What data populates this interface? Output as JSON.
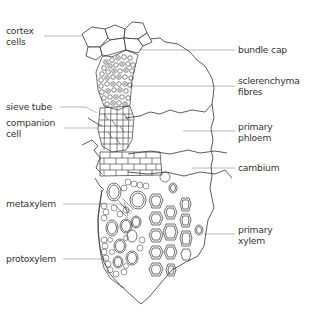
{
  "figure": {
    "colors": {
      "line": "#333333",
      "leader": "#9a9a9a",
      "text": "#333333",
      "background": "#ffffff"
    },
    "labels_left": [
      {
        "id": "cortex-cells",
        "lines": [
          "cortex",
          "cells"
        ]
      },
      {
        "id": "sieve-tube",
        "lines": [
          "sieve tube"
        ]
      },
      {
        "id": "companion-cell",
        "lines": [
          "companion",
          "cell"
        ]
      },
      {
        "id": "metaxylem",
        "lines": [
          "metaxylem"
        ]
      },
      {
        "id": "protoxylem",
        "lines": [
          "protoxylem"
        ]
      }
    ],
    "labels_right": [
      {
        "id": "bundle-cap",
        "lines": [
          "bundle cap"
        ]
      },
      {
        "id": "sclerenchyma-fibres",
        "lines": [
          "sclerenchyma",
          "fibres"
        ]
      },
      {
        "id": "primary-phloem",
        "lines": [
          "primary",
          "phloem"
        ]
      },
      {
        "id": "cambium",
        "lines": [
          "cambium"
        ]
      },
      {
        "id": "primary-xylem",
        "lines": [
          "primary",
          "xylem"
        ]
      }
    ]
  }
}
